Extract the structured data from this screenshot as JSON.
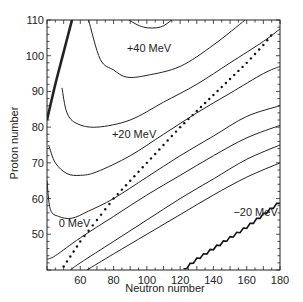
{
  "chart_data": {
    "type": "line",
    "title": "",
    "xlabel": "Neutron number",
    "ylabel": "Proton number",
    "xlim": [
      40,
      180
    ],
    "ylim": [
      40,
      110
    ],
    "xticks": [
      60,
      80,
      100,
      120,
      140,
      160,
      180
    ],
    "yticks": [
      50,
      60,
      70,
      80,
      90,
      100,
      110
    ],
    "grid": false,
    "legend": "none",
    "annotations": [
      {
        "text": "+40 MeV",
        "x": 88,
        "y": 101
      },
      {
        "text": "+20 MeV",
        "x": 79,
        "y": 77
      },
      {
        "text": "0 MeV",
        "x": 47,
        "y": 52
      },
      {
        "text": "−20 MeV",
        "x": 152,
        "y": 55
      }
    ],
    "series": [
      {
        "name": "contour top cap",
        "style": "solid",
        "points": [
          [
            89,
            110
          ],
          [
            98,
            108
          ],
          [
            108,
            108
          ],
          [
            115,
            110
          ]
        ]
      },
      {
        "name": "+40 MeV contour",
        "style": "solid",
        "points": [
          [
            65,
            110
          ],
          [
            72,
            99
          ],
          [
            80,
            96
          ],
          [
            88,
            94
          ],
          [
            100,
            94.5
          ],
          [
            120,
            97
          ],
          [
            140,
            103
          ],
          [
            159,
            110
          ]
        ]
      },
      {
        "name": "+20 MeV upper contour",
        "style": "solid",
        "points": [
          [
            49,
            91
          ],
          [
            52,
            84
          ],
          [
            58,
            81
          ],
          [
            70,
            80
          ],
          [
            90,
            82
          ],
          [
            110,
            87
          ],
          [
            130,
            92
          ],
          [
            150,
            98
          ],
          [
            170,
            104
          ],
          [
            180,
            107.5
          ]
        ]
      },
      {
        "name": "+20 MeV contour",
        "style": "solid",
        "points": [
          [
            41,
            75
          ],
          [
            45,
            70
          ],
          [
            52,
            67
          ],
          [
            60,
            66.5
          ],
          [
            70,
            67.5
          ],
          [
            90,
            72
          ],
          [
            110,
            78
          ],
          [
            130,
            84
          ],
          [
            150,
            89.5
          ],
          [
            170,
            95
          ],
          [
            180,
            97
          ]
        ]
      },
      {
        "name": "0 MeV contour",
        "style": "solid",
        "points": [
          [
            40,
            65
          ],
          [
            42,
            57
          ],
          [
            47,
            55
          ],
          [
            55,
            54.5
          ],
          [
            65,
            56.5
          ],
          [
            80,
            60
          ],
          [
            100,
            66
          ],
          [
            120,
            72
          ],
          [
            140,
            77.5
          ],
          [
            160,
            83
          ],
          [
            180,
            86
          ]
        ]
      },
      {
        "name": "contour line 6",
        "style": "solid",
        "points": [
          [
            40,
            43
          ],
          [
            45,
            44
          ],
          [
            60,
            49
          ],
          [
            80,
            55
          ],
          [
            100,
            61
          ],
          [
            120,
            66.5
          ],
          [
            140,
            72
          ],
          [
            160,
            77
          ],
          [
            180,
            80.5
          ]
        ]
      },
      {
        "name": "contour line 7",
        "style": "solid",
        "points": [
          [
            54,
            40
          ],
          [
            60,
            42
          ],
          [
            80,
            48
          ],
          [
            100,
            54
          ],
          [
            120,
            60
          ],
          [
            140,
            65.5
          ],
          [
            160,
            71
          ],
          [
            180,
            75
          ]
        ]
      },
      {
        "name": "contour line 8",
        "style": "solid",
        "points": [
          [
            64,
            40
          ],
          [
            80,
            44.5
          ],
          [
            100,
            50
          ],
          [
            120,
            55.5
          ],
          [
            140,
            61
          ],
          [
            160,
            66
          ],
          [
            180,
            70
          ]
        ]
      },
      {
        "name": "proton drip line",
        "style": "thick",
        "points": [
          [
            40,
            82
          ],
          [
            45,
            92
          ],
          [
            50,
            101
          ],
          [
            55,
            110
          ]
        ]
      },
      {
        "name": "beta-stability line",
        "style": "dotted",
        "points": [
          [
            50,
            41
          ],
          [
            60,
            48
          ],
          [
            70,
            54
          ],
          [
            80,
            60
          ],
          [
            90,
            65
          ],
          [
            100,
            70
          ],
          [
            110,
            75
          ],
          [
            120,
            80
          ],
          [
            130,
            84.5
          ],
          [
            140,
            89
          ],
          [
            150,
            93.5
          ],
          [
            160,
            98
          ],
          [
            170,
            103
          ],
          [
            177,
            107
          ]
        ]
      },
      {
        "name": "neutron drip line",
        "style": "stepped",
        "points": [
          [
            122,
            40
          ],
          [
            130,
            43
          ],
          [
            140,
            46
          ],
          [
            150,
            49
          ],
          [
            160,
            52
          ],
          [
            170,
            55.5
          ],
          [
            180,
            59
          ]
        ]
      }
    ]
  }
}
